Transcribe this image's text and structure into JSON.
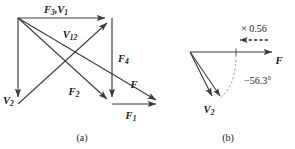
{
  "figure": {
    "background_color": "#ffffff",
    "line_color": "#3a3a3a",
    "text_color": "#1a1a1a",
    "accent_color": "#8d8d8d"
  },
  "panel_a": {
    "caption": "(a)",
    "labels": {
      "f3v1": "F",
      "f3v1_sub": "3",
      "f3v1_tail": ",V",
      "f3v1_tail_sub": "1",
      "v12": "V",
      "v12_sub": "12",
      "f4": "F",
      "f4_sub": "4",
      "v2": "V",
      "v2_sub": "2",
      "f2": "F",
      "f2_sub": "2",
      "f": "F",
      "f1": "F",
      "f1_sub": "1"
    },
    "vectors": [
      {
        "name": "F3,V1",
        "from": [
          18,
          18
        ],
        "to": [
          112,
          18
        ],
        "style": "solid",
        "direction": "right"
      },
      {
        "name": "V2",
        "from": [
          18,
          18
        ],
        "to": [
          18,
          104
        ],
        "style": "solid",
        "direction": "down"
      },
      {
        "name": "F4",
        "from": [
          112,
          18
        ],
        "to": [
          112,
          104
        ],
        "style": "solid",
        "direction": "down"
      },
      {
        "name": "F1",
        "from": [
          112,
          104
        ],
        "to": [
          163,
          104
        ],
        "style": "solid",
        "direction": "right"
      },
      {
        "name": "V12",
        "from": [
          18,
          18
        ],
        "to": [
          112,
          104
        ],
        "style": "solid",
        "direction": "down-right"
      },
      {
        "name": "F",
        "from": [
          18,
          18
        ],
        "to": [
          163,
          104
        ],
        "style": "solid",
        "direction": "down-right"
      },
      {
        "name": "F2-diag",
        "from": [
          18,
          104
        ],
        "to": [
          112,
          18
        ],
        "style": "solid",
        "direction": "up-right"
      }
    ]
  },
  "panel_b": {
    "caption": "(b)",
    "labels": {
      "scale": "× 0.56",
      "angle": "−56.3°",
      "f": "F",
      "v2": "V",
      "v2_sub": "2"
    },
    "vectors": [
      {
        "name": "F",
        "from": [
          190,
          52
        ],
        "to": [
          276,
          52
        ],
        "style": "solid",
        "direction": "right"
      },
      {
        "name": "V2",
        "from": [
          190,
          52
        ],
        "to": [
          215,
          100
        ],
        "style": "solid",
        "direction": "down-right"
      },
      {
        "name": "V2-scaled",
        "from": [
          190,
          52
        ],
        "to": [
          222,
          100
        ],
        "style": "solid",
        "direction": "down-right"
      },
      {
        "name": "scale-arrow",
        "from": [
          268,
          40
        ],
        "to": [
          236,
          40
        ],
        "style": "dashed",
        "direction": "left"
      }
    ],
    "angle_value": "-56.3",
    "scale_factor": "0.56"
  }
}
